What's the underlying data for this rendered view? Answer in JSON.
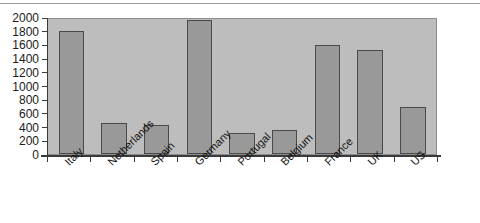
{
  "chart_data": {
    "type": "bar",
    "title": "",
    "subtitle": "",
    "xlabel": "",
    "ylabel": "",
    "categories": [
      "Italy",
      "Netherlands",
      "Spain",
      "Germany",
      "Portugal",
      "Belgium",
      "France",
      "UK",
      "US"
    ],
    "values": [
      1800,
      460,
      420,
      1950,
      300,
      345,
      1590,
      1520,
      680
    ],
    "ylim": [
      0,
      2000
    ],
    "ytick_labels": [
      "2000",
      "1800",
      "1600",
      "1400",
      "1200",
      "1000",
      "800",
      "600",
      "400",
      "200",
      "0"
    ],
    "ytick_values": [
      2000,
      1800,
      1600,
      1400,
      1200,
      1000,
      800,
      600,
      400,
      200,
      0
    ],
    "ytick_step": 200,
    "grid": false,
    "legend": false,
    "legend_position": "none",
    "bar_color": "#999999",
    "bar_border_color": "#4a4a4a",
    "plot_background": "#bdbdbd",
    "axis_color": "#3a3a3a",
    "label_rotation": -45
  }
}
